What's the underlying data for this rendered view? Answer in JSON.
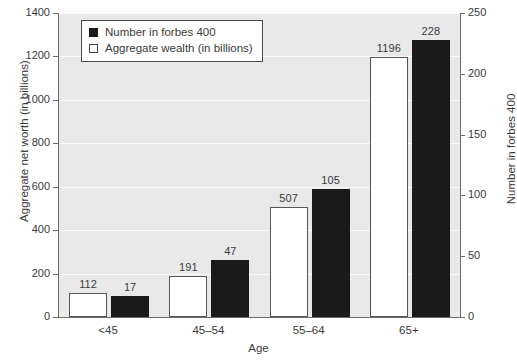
{
  "chart_data": {
    "type": "bar",
    "title": "",
    "subtitle": "",
    "xlabel": "Age",
    "ylabel": "Aggregate net worth (in billions)",
    "y2label": "Number in forbes 400",
    "categories": [
      "<45",
      "45–54",
      "55–64",
      "65+"
    ],
    "series": [
      {
        "name": "Aggregate wealth (in billions)",
        "axis": "left",
        "color": "#ffffff",
        "edge_color": "#555555",
        "values": [
          112,
          191,
          507,
          1196
        ]
      },
      {
        "name": "Number in forbes 400",
        "axis": "right",
        "color": "#1a1a1a",
        "edge_color": "#1a1a1a",
        "values": [
          17,
          47,
          105,
          228
        ]
      }
    ],
    "ylim": [
      0,
      1400
    ],
    "yticks": [
      0,
      200,
      400,
      600,
      800,
      1000,
      1200,
      1400
    ],
    "y2lim": [
      0,
      250
    ],
    "y2ticks": [
      0,
      50,
      100,
      150,
      200,
      250
    ],
    "grid": true,
    "grid_axis": "y",
    "legend_position": "upper left",
    "legend_entries": [
      {
        "label": "Number in forbes 400",
        "swatch": "black"
      },
      {
        "label": "Aggregate wealth (in billions)",
        "swatch": "white"
      }
    ],
    "plot_background": "#e9e9e9",
    "gridline_color": "#fbfbfb",
    "figure_background": "#ffffff",
    "data_labels_shown": true
  }
}
